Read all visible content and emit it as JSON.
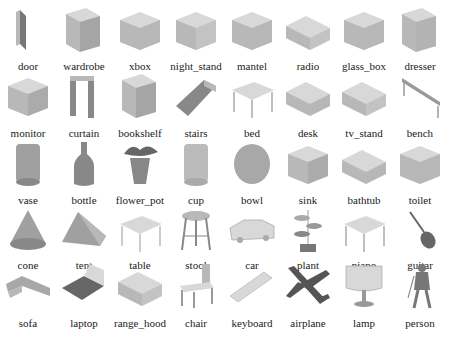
{
  "figure": {
    "columns": 8,
    "rows": 5,
    "items": [
      {
        "label": "door",
        "icon": "door-pointcloud-icon",
        "shape": "slab",
        "shade": "#777"
      },
      {
        "label": "wardrobe",
        "icon": "wardrobe-pointcloud-icon",
        "shape": "cabinet",
        "shade": "#999"
      },
      {
        "label": "xbox",
        "icon": "xbox-pointcloud-icon",
        "shape": "box",
        "shade": "#aaa"
      },
      {
        "label": "night_stand",
        "icon": "night-stand-pointcloud-icon",
        "shape": "box",
        "shade": "#bbb"
      },
      {
        "label": "mantel",
        "icon": "mantel-pointcloud-icon",
        "shape": "box",
        "shade": "#aaa"
      },
      {
        "label": "radio",
        "icon": "radio-pointcloud-icon",
        "shape": "flatbox",
        "shade": "#bbb"
      },
      {
        "label": "glass_box",
        "icon": "glass-box-pointcloud-icon",
        "shape": "box",
        "shade": "#aaa"
      },
      {
        "label": "dresser",
        "icon": "dresser-pointcloud-icon",
        "shape": "cabinet",
        "shade": "#aaa"
      },
      {
        "label": "monitor",
        "icon": "monitor-pointcloud-icon",
        "shape": "box",
        "shade": "#999"
      },
      {
        "label": "curtain",
        "icon": "curtain-pointcloud-icon",
        "shape": "frame",
        "shade": "#888"
      },
      {
        "label": "bookshelf",
        "icon": "bookshelf-pointcloud-icon",
        "shape": "cabinet",
        "shade": "#999"
      },
      {
        "label": "stairs",
        "icon": "stairs-pointcloud-icon",
        "shape": "ramp",
        "shade": "#888"
      },
      {
        "label": "bed",
        "icon": "bed-pointcloud-icon",
        "shape": "table",
        "shade": "#aaa"
      },
      {
        "label": "desk",
        "icon": "desk-pointcloud-icon",
        "shape": "flatbox",
        "shade": "#aaa"
      },
      {
        "label": "tv_stand",
        "icon": "tv-stand-pointcloud-icon",
        "shape": "flatbox",
        "shade": "#bbb"
      },
      {
        "label": "bench",
        "icon": "bench-pointcloud-icon",
        "shape": "bench",
        "shade": "#999"
      },
      {
        "label": "vase",
        "icon": "vase-pointcloud-icon",
        "shape": "cylinder",
        "shade": "#888"
      },
      {
        "label": "bottle",
        "icon": "bottle-pointcloud-icon",
        "shape": "bottle",
        "shade": "#888"
      },
      {
        "label": "flower_pot",
        "icon": "flower-pot-pointcloud-icon",
        "shape": "pot",
        "shade": "#888"
      },
      {
        "label": "cup",
        "icon": "cup-pointcloud-icon",
        "shape": "cylinder",
        "shade": "#aaa"
      },
      {
        "label": "bowl",
        "icon": "bowl-pointcloud-icon",
        "shape": "bowl",
        "shade": "#999"
      },
      {
        "label": "sink",
        "icon": "sink-pointcloud-icon",
        "shape": "box",
        "shade": "#999"
      },
      {
        "label": "bathtub",
        "icon": "bathtub-pointcloud-icon",
        "shape": "flatbox",
        "shade": "#aaa"
      },
      {
        "label": "toilet",
        "icon": "toilet-pointcloud-icon",
        "shape": "box",
        "shade": "#aaa"
      },
      {
        "label": "cone",
        "icon": "cone-pointcloud-icon",
        "shape": "cone",
        "shade": "#888"
      },
      {
        "label": "tent",
        "icon": "tent-pointcloud-icon",
        "shape": "tent",
        "shade": "#888"
      },
      {
        "label": "table",
        "icon": "table-pointcloud-icon",
        "shape": "table",
        "shade": "#bbb"
      },
      {
        "label": "stool",
        "icon": "stool-pointcloud-icon",
        "shape": "stool",
        "shade": "#888"
      },
      {
        "label": "car",
        "icon": "car-pointcloud-icon",
        "shape": "car",
        "shade": "#aaa"
      },
      {
        "label": "plant",
        "icon": "plant-pointcloud-icon",
        "shape": "plant",
        "shade": "#777"
      },
      {
        "label": "piano",
        "icon": "piano-pointcloud-icon",
        "shape": "table",
        "shade": "#aaa"
      },
      {
        "label": "guitar",
        "icon": "guitar-pointcloud-icon",
        "shape": "guitar",
        "shade": "#666"
      },
      {
        "label": "sofa",
        "icon": "sofa-pointcloud-icon",
        "shape": "sofa",
        "shade": "#999"
      },
      {
        "label": "laptop",
        "icon": "laptop-pointcloud-icon",
        "shape": "laptop",
        "shade": "#666"
      },
      {
        "label": "range_hood",
        "icon": "range-hood-pointcloud-icon",
        "shape": "flatbox",
        "shade": "#bbb"
      },
      {
        "label": "chair",
        "icon": "chair-pointcloud-icon",
        "shape": "chair",
        "shade": "#999"
      },
      {
        "label": "keyboard",
        "icon": "keyboard-pointcloud-icon",
        "shape": "keyboard",
        "shade": "#bbb"
      },
      {
        "label": "airplane",
        "icon": "airplane-pointcloud-icon",
        "shape": "airplane",
        "shade": "#555"
      },
      {
        "label": "lamp",
        "icon": "lamp-pointcloud-icon",
        "shape": "lamp",
        "shade": "#999"
      },
      {
        "label": "person",
        "icon": "person-pointcloud-icon",
        "shape": "person",
        "shade": "#777"
      }
    ]
  }
}
